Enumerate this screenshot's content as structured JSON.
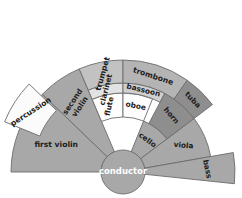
{
  "diagram": {
    "type": "semicircular-seating-chart",
    "background_color": "#ffffff",
    "stroke_color": "#6c6c6c",
    "center": {
      "x": 123,
      "y": 172
    },
    "conductor": {
      "label": "conductor",
      "radius": 22,
      "fill": "#a8a8a8",
      "text_color": "#ffffff",
      "font_size": 8.5
    },
    "rings": [
      {
        "name": "strings-inner",
        "inner_radius": 22,
        "outer_radius": 55
      },
      {
        "name": "woodwind-inner",
        "inner_radius": 55,
        "outer_radius": 79
      },
      {
        "name": "woodwind-outer",
        "inner_radius": 79,
        "outer_radius": 89
      },
      {
        "name": "brass-outer",
        "inner_radius": 89,
        "outer_radius": 112
      }
    ],
    "sections": [
      {
        "id": "first-violin",
        "label": "first violin",
        "fill": "#a8a8a8",
        "start_angle": 180,
        "end_angle": 136,
        "inner_radius": 22,
        "outer_radius": 112,
        "label_radius": 72,
        "label_rotation": 0,
        "font_size": 7.6,
        "lines": [
          "first violin"
        ]
      },
      {
        "id": "second-violin",
        "label": "second violin",
        "fill": "#a8a8a8",
        "start_angle": 136,
        "end_angle": 113,
        "inner_radius": 22,
        "outer_radius": 112,
        "label_radius": 82,
        "label_rotation": -56,
        "font_size": 7.4,
        "lines": [
          "second",
          "violin"
        ]
      },
      {
        "id": "cello",
        "label": "cello",
        "fill": "#a8a8a8",
        "start_angle": 68,
        "end_angle": 37,
        "inner_radius": 22,
        "outer_radius": 55,
        "label_radius": 40,
        "label_rotation": 37,
        "font_size": 7.4,
        "lines": [
          "cello"
        ]
      },
      {
        "id": "viola",
        "label": "viola",
        "fill": "#a8a8a8",
        "start_angle": 37,
        "end_angle": 10,
        "inner_radius": 22,
        "outer_radius": 89,
        "label_radius": 66,
        "label_rotation": 5,
        "font_size": 7.4,
        "lines": [
          "viola"
        ]
      },
      {
        "id": "bass",
        "label": "bass",
        "fill": "#a8a8a8",
        "start_angle": 10,
        "end_angle": -6,
        "inner_radius": 22,
        "outer_radius": 112,
        "label_radius": 84,
        "label_rotation": 78,
        "font_size": 7.4,
        "lines": [
          "bass"
        ]
      },
      {
        "id": "flute",
        "label": "flute",
        "fill": "#fdfdfd",
        "start_angle": 113,
        "end_angle": 90,
        "inner_radius": 55,
        "outer_radius": 79,
        "label_radius": 67,
        "label_rotation": -78,
        "font_size": 7.4,
        "lines": [
          "flute"
        ]
      },
      {
        "id": "oboe",
        "label": "oboe",
        "fill": "#fdfdfd",
        "start_angle": 90,
        "end_angle": 68,
        "inner_radius": 55,
        "outer_radius": 79,
        "label_radius": 67,
        "label_rotation": 11,
        "font_size": 7.4,
        "lines": [
          "oboe"
        ]
      },
      {
        "id": "clarinet",
        "label": "clarinet",
        "fill": "#e2e2e2",
        "start_angle": 113,
        "end_angle": 90,
        "inner_radius": 79,
        "outer_radius": 89,
        "label_radius": 84,
        "label_rotation": -76,
        "font_size": 7.4,
        "lines": [
          "clarinet"
        ]
      },
      {
        "id": "bassoon",
        "label": "bassoon",
        "fill": "#cfcfcf",
        "start_angle": 90,
        "end_angle": 62,
        "inner_radius": 79,
        "outer_radius": 89,
        "label_radius": 84,
        "label_rotation": 14,
        "font_size": 7.4,
        "lines": [
          "bassoon"
        ]
      },
      {
        "id": "trumpet",
        "label": "trumpet",
        "fill": "#c2c2c2",
        "start_angle": 113,
        "end_angle": 90,
        "inner_radius": 89,
        "outer_radius": 112,
        "label_radius": 100,
        "label_rotation": -74,
        "font_size": 7.6,
        "lines": [
          "trumpet"
        ]
      },
      {
        "id": "trombone",
        "label": "trombone",
        "fill": "#b4b4b4",
        "start_angle": 90,
        "end_angle": 55,
        "inner_radius": 89,
        "outer_radius": 112,
        "label_radius": 100,
        "label_rotation": 18,
        "font_size": 7.6,
        "lines": [
          "trombone"
        ]
      },
      {
        "id": "horn",
        "label": "horn",
        "fill": "#8e8e8e",
        "start_angle": 62,
        "end_angle": 37,
        "inner_radius": 55,
        "outer_radius": 89,
        "label_radius": 74,
        "label_rotation": 50,
        "font_size": 7.4,
        "lines": [
          "horn"
        ]
      },
      {
        "id": "tuba",
        "label": "tuba",
        "fill": "#8e8e8e",
        "start_angle": 55,
        "end_angle": 37,
        "inner_radius": 89,
        "outer_radius": 112,
        "label_radius": 100,
        "label_rotation": 46,
        "font_size": 7.4,
        "lines": [
          "tuba"
        ]
      }
    ],
    "detached_sections": [
      {
        "id": "percussion",
        "label": "percussion",
        "fill": "#fbfbfb",
        "start_angle": 158,
        "end_angle": 136,
        "inner_radius": 80,
        "outer_radius": 118,
        "offset_x": -9,
        "offset_y": -6,
        "label_radius": 99,
        "label_rotation": -33,
        "font_size": 7.6,
        "lines": [
          "percussion"
        ]
      }
    ]
  }
}
